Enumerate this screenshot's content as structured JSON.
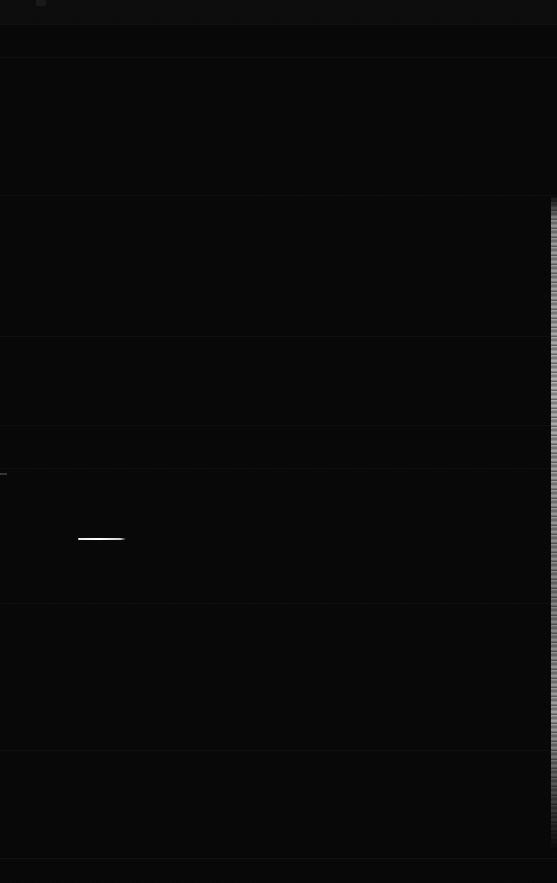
{
  "screen": {
    "width": 557,
    "height": 883,
    "description": "Near-black screen capture with almost no visible content",
    "background_color": "#050505",
    "state_label": "dark-screen"
  },
  "topbar": {
    "height": 24,
    "color": "#0a0a0a",
    "indicator": {
      "name": "top-left-indicator",
      "x": 36,
      "y": 0,
      "width": 10,
      "height": 6,
      "color": "#1a1a1a"
    }
  },
  "regions": [
    {
      "name": "region-header",
      "top": 24,
      "height": 33,
      "tint": "#070707"
    },
    {
      "name": "region-upper",
      "top": 57,
      "height": 138,
      "tint": "#060606"
    },
    {
      "name": "region-mid-upper",
      "top": 195,
      "height": 141,
      "tint": "#070707"
    },
    {
      "name": "region-mid",
      "top": 336,
      "height": 89,
      "tint": "#060606"
    },
    {
      "name": "region-mid-lower",
      "top": 425,
      "height": 43,
      "tint": "#070707"
    },
    {
      "name": "region-content",
      "top": 468,
      "height": 135,
      "tint": "#060606"
    },
    {
      "name": "region-lower",
      "top": 603,
      "height": 147,
      "tint": "#070707"
    },
    {
      "name": "region-footer-area",
      "top": 750,
      "height": 108,
      "tint": "#060606"
    },
    {
      "name": "region-footer",
      "top": 858,
      "height": 25,
      "tint": "#050505"
    }
  ],
  "dividers": [
    {
      "name": "divider-header",
      "y": 24
    },
    {
      "name": "divider-subheader",
      "y": 57
    },
    {
      "name": "divider-upper",
      "y": 195
    },
    {
      "name": "divider-mid-upper",
      "y": 336
    },
    {
      "name": "divider-mid",
      "y": 425
    },
    {
      "name": "divider-mid-lower",
      "y": 468
    },
    {
      "name": "divider-content",
      "y": 603
    },
    {
      "name": "divider-lower",
      "y": 750
    },
    {
      "name": "divider-footer",
      "y": 858
    }
  ],
  "highlight_line": {
    "name": "bright-horizontal-line",
    "x": 78,
    "y": 538,
    "width": 48,
    "height": 2,
    "color": "#ffffff"
  },
  "left_tick": {
    "name": "left-edge-tick",
    "x": 0,
    "y": 473,
    "width": 7,
    "height": 2,
    "color": "#2e2e2e"
  },
  "edge_strip": {
    "name": "right-edge-light-strip",
    "x": 551,
    "top": 195,
    "height": 655,
    "width": 6,
    "color": "#b8b8b8"
  }
}
